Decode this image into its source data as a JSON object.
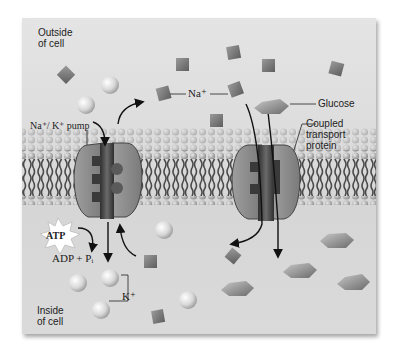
{
  "diagram": {
    "regions": {
      "outside": "Outside of cell",
      "outside_line1": "Outside",
      "outside_line2": "of cell",
      "inside_line1": "Inside",
      "inside_line2": "of cell"
    },
    "labels": {
      "pump": "Na⁺/ K⁺ pump",
      "sodium": "Na⁺",
      "glucose": "Glucose",
      "coupled_line1": "Coupled",
      "coupled_line2": "transport",
      "coupled_line3": "protein",
      "atp": "ATP",
      "adp": "ADP + Pᵢ",
      "potassium": "K⁺"
    },
    "legend_shapes": {
      "sodium_ion": "square",
      "potassium_ion": "sphere",
      "glucose": "hexagon"
    },
    "colors": {
      "background": "#dcdcdc",
      "membrane_head": "#a8a8a8",
      "protein": "#8a8a8a",
      "protein_channel": "#4a4a4a",
      "ion_square": "#7a7a7a",
      "sphere": "#e0e0e0"
    }
  }
}
